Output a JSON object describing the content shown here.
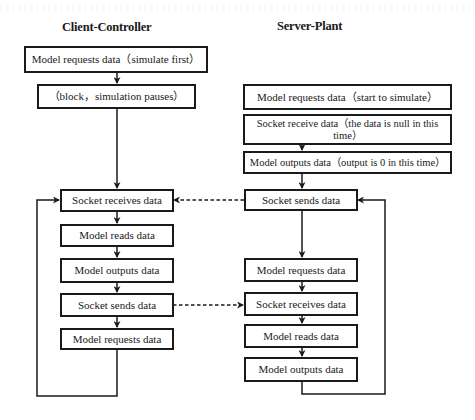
{
  "diagram": {
    "type": "flowchart",
    "columns": [
      {
        "title": "Client-Controller",
        "nodes": [
          "Model requests data（simulate first）",
          "（block，simulation pauses）",
          "Socket receives data",
          "Model reads data",
          "Model outputs data",
          "Socket sends data",
          "Model requests data"
        ]
      },
      {
        "title": "Server-Plant",
        "nodes": [
          "Model requests data（start to simulate）",
          "Socket receive data（the data is null in this time）",
          "Model outputs data（output is 0 in this time）",
          "Socket sends data",
          "Model requests data",
          "Socket receives data",
          "Model reads data",
          "Model outputs data"
        ]
      }
    ],
    "edges": [
      {
        "from": "Server-Plant: Socket sends data",
        "to": "Client-Controller: Socket receives data",
        "style": "dashed"
      },
      {
        "from": "Client-Controller: Socket sends data",
        "to": "Server-Plant: Socket receives data",
        "style": "dashed"
      },
      {
        "from": "Client-Controller: Model requests data",
        "to": "Client-Controller: Socket receives data",
        "style": "loop"
      },
      {
        "from": "Server-Plant: Model outputs data",
        "to": "Server-Plant: Socket sends data",
        "style": "loop"
      }
    ],
    "colors": {
      "line": "#1a1a1a",
      "background": "#ffffff"
    }
  }
}
